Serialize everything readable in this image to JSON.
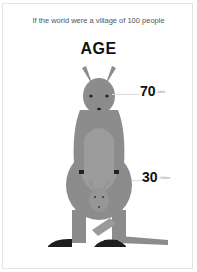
{
  "subtitle": "If the world were a village of 100 people",
  "title": "AGE",
  "stats": [
    {
      "value": "70",
      "label": "adults"
    },
    {
      "value": "30",
      "label": "children"
    }
  ],
  "colors": {
    "body": "#8c8c8c",
    "belly": "#9c9c9c",
    "joey": "#969696",
    "feet": "#222222",
    "text": "#111111"
  }
}
